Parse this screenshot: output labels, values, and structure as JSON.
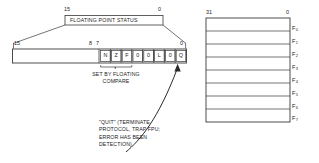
{
  "diagram": {
    "title_box": {
      "label": "FLOATING POINT STATUS",
      "bit_high": "15",
      "bit_low": "0"
    },
    "status_register": {
      "bit_high": "15",
      "bit_mid_high": "8",
      "bit_mid_low": "7",
      "bit_low": "0",
      "cells": [
        {
          "name": "n-flag",
          "text": "N"
        },
        {
          "name": "z-flag",
          "text": "Z"
        },
        {
          "name": "f-flag",
          "text": "F"
        },
        {
          "name": "zero-bit-4",
          "text": "0"
        },
        {
          "name": "zero-bit-3",
          "text": "0"
        },
        {
          "name": "l-flag",
          "text": "L"
        },
        {
          "name": "zero-bit-2",
          "text": "0"
        },
        {
          "name": "q-flag",
          "text": "Q"
        }
      ],
      "brace_caption_line1": "SET BY FLOATING",
      "brace_caption_line2": "COMPARE"
    },
    "quit_annotation": {
      "line1": "\"QUIT\" (TERMINATE",
      "line2": "PROTOCOL, TRAP FPU;",
      "line3": "ERROR HAS BEEN",
      "line4": "DETECTION)"
    },
    "register_file": {
      "bit_high": "31",
      "bit_low": "0",
      "registers": [
        {
          "name": "register-f0",
          "base": "F",
          "sub": "0"
        },
        {
          "name": "register-f1",
          "base": "F",
          "sub": "1"
        },
        {
          "name": "register-f2",
          "base": "F",
          "sub": "2"
        },
        {
          "name": "register-f3",
          "base": "F",
          "sub": "3"
        },
        {
          "name": "register-f4",
          "base": "F",
          "sub": "4"
        },
        {
          "name": "register-f5",
          "base": "F",
          "sub": "5"
        },
        {
          "name": "register-f6",
          "base": "F",
          "sub": "6"
        },
        {
          "name": "register-f7",
          "base": "F",
          "sub": "7"
        }
      ]
    },
    "colors": {
      "ink": "#222222",
      "line": "#3a3a3a",
      "background": "#ffffff"
    }
  }
}
